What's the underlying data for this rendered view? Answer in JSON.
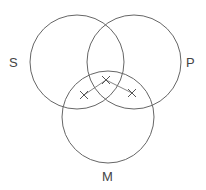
{
  "diagram": {
    "type": "venn",
    "sets": [
      {
        "id": "S",
        "label": "S",
        "cx": 77,
        "cy": 62,
        "r": 47
      },
      {
        "id": "P",
        "label": "P",
        "cx": 134,
        "cy": 62,
        "r": 47
      },
      {
        "id": "M",
        "label": "M",
        "cx": 108,
        "cy": 117,
        "r": 46
      }
    ],
    "marks": [
      {
        "symbol": "x",
        "x": 84,
        "y": 95
      },
      {
        "symbol": "x",
        "x": 106,
        "y": 80
      },
      {
        "symbol": "x",
        "x": 132,
        "y": 93
      }
    ],
    "links": [
      {
        "from": 0,
        "to": 1
      },
      {
        "from": 1,
        "to": 2
      }
    ],
    "colors": {
      "stroke": "#666666",
      "text": "#444444",
      "background": "#ffffff"
    }
  }
}
